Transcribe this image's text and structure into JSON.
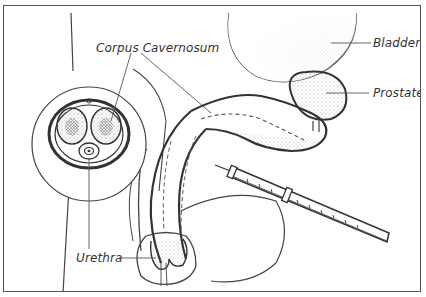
{
  "diagram": {
    "labels": {
      "corpus_cavernosum": "Corpus Cavernosum",
      "bladder": "Bladder",
      "prostate": "Prostate",
      "urethra": "Urethra"
    },
    "elements": [
      {
        "name": "cross-section-inset",
        "description": "circular inset showing cross section with two corpora cavernosa and urethra"
      },
      {
        "name": "bladder",
        "description": "stippled rounded organ at top right"
      },
      {
        "name": "prostate",
        "description": "stippled organ below bladder"
      },
      {
        "name": "penis-sagittal",
        "description": "side view of shaft with corpus cavernosum"
      },
      {
        "name": "syringe",
        "description": "syringe with needle injecting into shaft from lower right"
      }
    ],
    "colors": {
      "line": "#444444",
      "stipple": "#666666",
      "background": "#ffffff"
    }
  }
}
